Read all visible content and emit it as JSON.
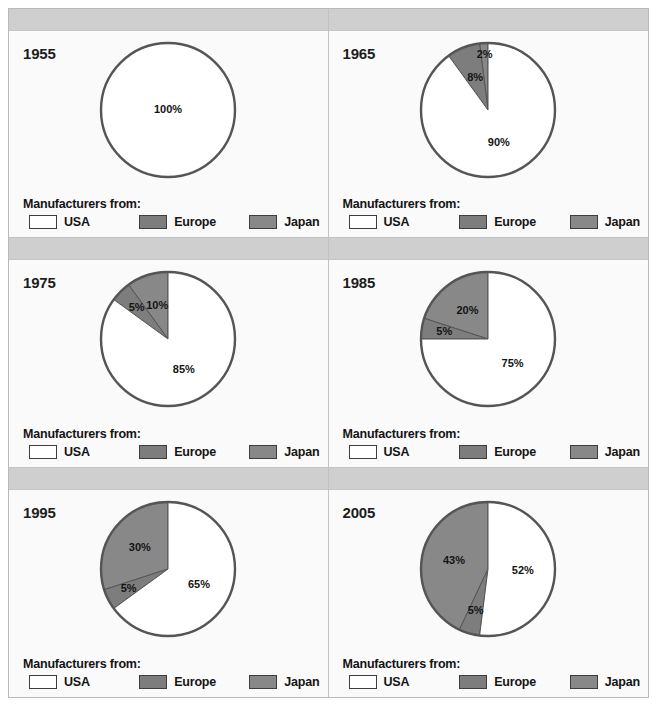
{
  "figure": {
    "caption": ""
  },
  "legend": {
    "title": "Manufacturers from:",
    "items": [
      {
        "label": "USA",
        "color": "#ffffff"
      },
      {
        "label": "Europe",
        "color": "#7d7d7d"
      },
      {
        "label": "Japan",
        "color": "#888888"
      }
    ]
  },
  "panels": [
    {
      "year": "1955"
    },
    {
      "year": "1965"
    },
    {
      "year": "1975"
    },
    {
      "year": "1985"
    },
    {
      "year": "1995"
    },
    {
      "year": "2005"
    }
  ],
  "chart_data": [
    {
      "type": "pie",
      "title": "1955",
      "labels": [
        "USA",
        "Europe",
        "Japan"
      ],
      "values": [
        100,
        0,
        0
      ],
      "value_labels": [
        "100%",
        "",
        ""
      ],
      "colors": [
        "#ffffff",
        "#7d7d7d",
        "#888888"
      ],
      "ylabel": "",
      "xlabel": "",
      "legend_position": "bottom"
    },
    {
      "type": "pie",
      "title": "1965",
      "labels": [
        "USA",
        "Europe",
        "Japan"
      ],
      "values": [
        90,
        8,
        2
      ],
      "value_labels": [
        "90%",
        "8%",
        "2%"
      ],
      "colors": [
        "#ffffff",
        "#7d7d7d",
        "#888888"
      ],
      "ylabel": "",
      "xlabel": "",
      "legend_position": "bottom"
    },
    {
      "type": "pie",
      "title": "1975",
      "labels": [
        "USA",
        "Europe",
        "Japan"
      ],
      "values": [
        85,
        5,
        10
      ],
      "value_labels": [
        "85%",
        "5%",
        "10%"
      ],
      "colors": [
        "#ffffff",
        "#7d7d7d",
        "#888888"
      ],
      "ylabel": "",
      "xlabel": "",
      "legend_position": "bottom"
    },
    {
      "type": "pie",
      "title": "1985",
      "labels": [
        "USA",
        "Europe",
        "Japan"
      ],
      "values": [
        75,
        5,
        20
      ],
      "value_labels": [
        "75%",
        "5%",
        "20%"
      ],
      "colors": [
        "#ffffff",
        "#7d7d7d",
        "#888888"
      ],
      "ylabel": "",
      "xlabel": "",
      "legend_position": "bottom"
    },
    {
      "type": "pie",
      "title": "1995",
      "labels": [
        "USA",
        "Europe",
        "Japan"
      ],
      "values": [
        65,
        5,
        30
      ],
      "value_labels": [
        "65%",
        "5%",
        "30%"
      ],
      "colors": [
        "#ffffff",
        "#7d7d7d",
        "#888888"
      ],
      "ylabel": "",
      "xlabel": "",
      "legend_position": "bottom"
    },
    {
      "type": "pie",
      "title": "2005",
      "labels": [
        "USA",
        "Europe",
        "Japan"
      ],
      "values": [
        52,
        5,
        43
      ],
      "value_labels": [
        "52%",
        "5%",
        "43%"
      ],
      "colors": [
        "#ffffff",
        "#7d7d7d",
        "#888888"
      ],
      "ylabel": "",
      "xlabel": "",
      "legend_position": "bottom"
    }
  ],
  "style": {
    "pie_stroke": "#555555",
    "slice_divider": "#555555",
    "header_fill": "#cfcfcf",
    "panel_fill": "#fafafa"
  }
}
